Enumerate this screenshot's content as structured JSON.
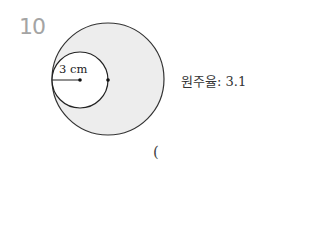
{
  "problem": {
    "number": "10",
    "pi_label": "원주율: 3.1",
    "answer_paren": "(",
    "figure": {
      "radius_label": "3 cm",
      "big_circle": {
        "cx": 108,
        "cy": 79,
        "r": 56,
        "fill": "#ededed",
        "stroke": "#333333"
      },
      "small_circle": {
        "cx": 80,
        "cy": 80,
        "r": 28,
        "fill": "#ffffff",
        "stroke": "#222222"
      }
    }
  }
}
